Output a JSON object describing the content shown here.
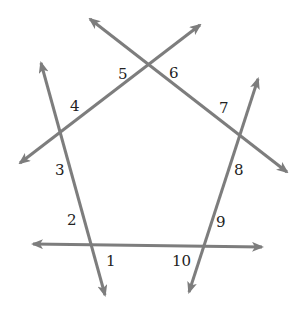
{
  "figure": {
    "line_color": "#7d7d7d",
    "label_color": "#222222",
    "vertices": {
      "top": [
        147,
        66
      ],
      "right": [
        238,
        135
      ],
      "bottom_right": [
        201,
        246
      ],
      "bottom_left": [
        91,
        244
      ],
      "left": [
        60,
        132
      ]
    },
    "lines": [
      {
        "name": "line-left-top",
        "from": [
          20,
          163
        ],
        "to": [
          200,
          25
        ]
      },
      {
        "name": "line-top-right",
        "from": [
          90,
          19
        ],
        "to": [
          287,
          172
        ]
      },
      {
        "name": "line-right-bottom-right",
        "from": [
          258,
          79
        ],
        "to": [
          189,
          292
        ]
      },
      {
        "name": "line-bottom",
        "from": [
          33,
          244
        ],
        "to": [
          262,
          247
        ]
      },
      {
        "name": "line-bottom-left-left",
        "from": [
          105,
          295
        ],
        "to": [
          41,
          63
        ]
      }
    ],
    "angle_labels": [
      {
        "text": "1",
        "x": 106,
        "y": 266
      },
      {
        "text": "2",
        "x": 67,
        "y": 225
      },
      {
        "text": "3",
        "x": 55,
        "y": 175
      },
      {
        "text": "4",
        "x": 70,
        "y": 111
      },
      {
        "text": "5",
        "x": 118,
        "y": 79
      },
      {
        "text": "6",
        "x": 169,
        "y": 78
      },
      {
        "text": "7",
        "x": 219,
        "y": 113
      },
      {
        "text": "8",
        "x": 234,
        "y": 175
      },
      {
        "text": "9",
        "x": 216,
        "y": 227
      },
      {
        "text": "10",
        "x": 172,
        "y": 266
      }
    ]
  }
}
